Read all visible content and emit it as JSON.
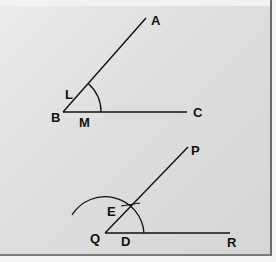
{
  "figure": {
    "colors": {
      "ink": "#111111",
      "background": "#e0e0e0",
      "frame": "#6b6b6b"
    },
    "angle_given": {
      "vertex": "B",
      "ray_points": [
        "A",
        "C"
      ],
      "arc_points": [
        "L",
        "M"
      ],
      "labels": {
        "A": "A",
        "B": "B",
        "C": "C",
        "L": "L",
        "M": "M"
      }
    },
    "angle_constructed": {
      "vertex": "Q",
      "ray_points": [
        "P",
        "R"
      ],
      "arc_points": [
        "E",
        "D"
      ],
      "labels": {
        "P": "P",
        "Q": "Q",
        "R": "R",
        "E": "E",
        "D": "D"
      }
    }
  }
}
